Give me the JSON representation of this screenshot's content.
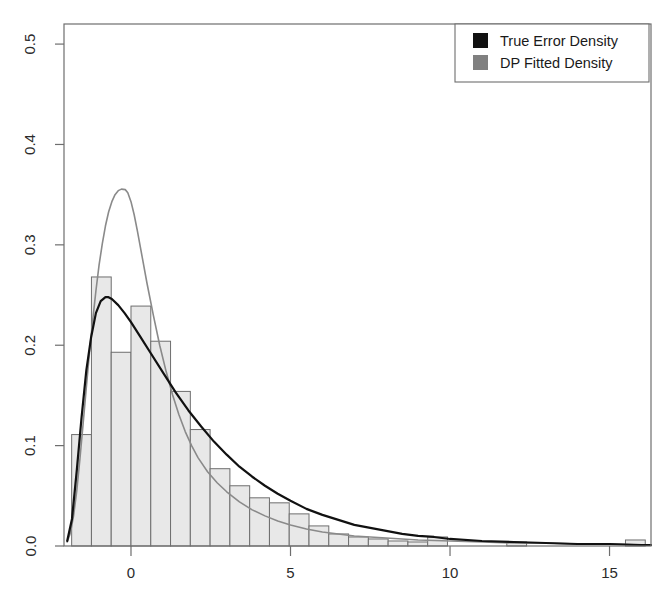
{
  "chart_data": {
    "type": "bar",
    "title": "",
    "subtitle": "",
    "xlabel": "",
    "ylabel": "",
    "xlim": [
      -2.1,
      16.3
    ],
    "ylim": [
      0.0,
      0.52
    ],
    "grid": false,
    "x_ticks": [
      0,
      5,
      10,
      15
    ],
    "x_tick_labels": [
      "0",
      "5",
      "10",
      "15"
    ],
    "y_ticks": [
      0.0,
      0.1,
      0.2,
      0.3,
      0.4,
      0.5
    ],
    "y_tick_labels": [
      "0.0",
      "0.1",
      "0.2",
      "0.3",
      "0.4",
      "0.5"
    ],
    "legend_position": "top-right",
    "legend": [
      {
        "label": "True Error Density",
        "color": "#111111",
        "swatch": "filled-square"
      },
      {
        "label": "DP Fitted Density",
        "color": "#808080",
        "swatch": "filled-square"
      }
    ],
    "histogram": {
      "name": "Error histogram",
      "fill_color": "#e8e8e8",
      "edge_color": "#6e6e6e",
      "bin_width": 0.62,
      "bin_starts": [
        -1.86,
        -1.24,
        -0.62,
        0.0,
        0.62,
        1.24,
        1.86,
        2.48,
        3.1,
        3.72,
        4.34,
        4.96,
        5.58,
        6.2,
        6.82,
        7.44,
        8.06,
        8.68,
        9.3,
        9.92,
        10.54,
        11.16,
        11.78,
        12.4,
        13.02,
        13.64,
        14.26,
        14.88,
        15.5
      ],
      "densities": [
        0.111,
        0.268,
        0.193,
        0.239,
        0.204,
        0.154,
        0.116,
        0.077,
        0.06,
        0.048,
        0.043,
        0.032,
        0.02,
        0.012,
        0.009,
        0.007,
        0.005,
        0.004,
        0.009,
        0.0,
        0.0,
        0.0,
        0.004,
        0.0,
        0.0,
        0.0,
        0.0,
        0.0,
        0.006
      ]
    },
    "series": [
      {
        "name": "True Error Density",
        "color": "#111111",
        "line_width": 2.2,
        "peak_x": -0.72,
        "peak_y": 0.248,
        "x": [
          -2.0,
          -1.85,
          -1.7,
          -1.55,
          -1.4,
          -1.25,
          -1.1,
          -0.95,
          -0.8,
          -0.72,
          -0.6,
          -0.4,
          -0.2,
          0.0,
          0.3,
          0.6,
          1.0,
          1.4,
          1.8,
          2.2,
          2.6,
          3.0,
          3.4,
          3.8,
          4.2,
          4.6,
          5.0,
          5.5,
          6.0,
          6.5,
          7.0,
          7.5,
          8.0,
          8.5,
          9.0,
          9.5,
          10.0,
          11.0,
          12.0,
          13.0,
          14.0,
          15.0,
          16.0,
          16.3
        ],
        "y": [
          0.005,
          0.027,
          0.075,
          0.128,
          0.175,
          0.208,
          0.232,
          0.244,
          0.248,
          0.248,
          0.246,
          0.24,
          0.232,
          0.223,
          0.208,
          0.193,
          0.173,
          0.153,
          0.135,
          0.119,
          0.104,
          0.091,
          0.079,
          0.069,
          0.06,
          0.052,
          0.045,
          0.037,
          0.031,
          0.026,
          0.021,
          0.018,
          0.015,
          0.012,
          0.01,
          0.009,
          0.007,
          0.005,
          0.004,
          0.003,
          0.002,
          0.002,
          0.001,
          0.001
        ]
      },
      {
        "name": "DP Fitted Density",
        "color": "#8a8a8a",
        "line_width": 1.6,
        "peak_x": -0.18,
        "peak_y": 0.355,
        "x": [
          -2.0,
          -1.9,
          -1.8,
          -1.7,
          -1.6,
          -1.5,
          -1.4,
          -1.3,
          -1.2,
          -1.1,
          -1.0,
          -0.9,
          -0.8,
          -0.7,
          -0.6,
          -0.5,
          -0.4,
          -0.3,
          -0.18,
          -0.1,
          0.0,
          0.1,
          0.2,
          0.35,
          0.5,
          0.7,
          0.9,
          1.1,
          1.3,
          1.5,
          1.7,
          1.9,
          2.1,
          2.4,
          2.7,
          3.0,
          3.4,
          3.8,
          4.2,
          4.6,
          5.0,
          5.5,
          6.0,
          6.5,
          7.0,
          7.5,
          8.0,
          9.0,
          10.0,
          11.0,
          12.0,
          13.0,
          14.0,
          15.0,
          16.0,
          16.3
        ],
        "y": [
          0.004,
          0.013,
          0.03,
          0.055,
          0.087,
          0.122,
          0.158,
          0.193,
          0.225,
          0.254,
          0.28,
          0.301,
          0.319,
          0.333,
          0.343,
          0.35,
          0.354,
          0.3555,
          0.355,
          0.352,
          0.343,
          0.33,
          0.314,
          0.288,
          0.262,
          0.23,
          0.2,
          0.174,
          0.151,
          0.131,
          0.114,
          0.1,
          0.088,
          0.074,
          0.063,
          0.054,
          0.044,
          0.036,
          0.03,
          0.025,
          0.021,
          0.017,
          0.014,
          0.012,
          0.01,
          0.009,
          0.008,
          0.006,
          0.005,
          0.004,
          0.003,
          0.003,
          0.002,
          0.002,
          0.001,
          0.001
        ]
      }
    ]
  },
  "axis": {
    "frame_color": "#6e6e6e"
  }
}
